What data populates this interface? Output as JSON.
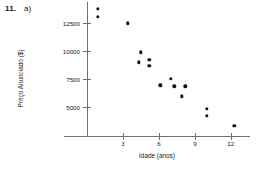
{
  "exercise": {
    "number": "11.",
    "part": "a)"
  },
  "chart_data": {
    "type": "scatter",
    "title": "",
    "xlabel": "Idade (anos)",
    "ylabel": "Preço Anunciado ($)",
    "xticks": [
      3,
      6,
      9,
      12
    ],
    "xtick_labels": [
      "3",
      "6",
      "9",
      "12"
    ],
    "yticks": [
      5000,
      7500,
      10000,
      12500
    ],
    "ytick_labels": [
      "5000",
      "7500",
      "10000",
      "12500"
    ],
    "xlim": [
      0,
      13.6
    ],
    "ylim": [
      2400,
      14400
    ],
    "grid": false,
    "legend": "none",
    "marker": "filled-circle",
    "marker_color": "#111111",
    "axis_color": "#6f6f6f",
    "points": [
      {
        "x": 0.9,
        "y": 13800
      },
      {
        "x": 0.9,
        "y": 13100
      },
      {
        "x": 3.4,
        "y": 12500
      },
      {
        "x": 4.3,
        "y": 9000
      },
      {
        "x": 4.5,
        "y": 9900
      },
      {
        "x": 5.2,
        "y": 9200
      },
      {
        "x": 5.2,
        "y": 8700
      },
      {
        "x": 6.1,
        "y": 6950
      },
      {
        "x": 7.0,
        "y": 7500
      },
      {
        "x": 7.3,
        "y": 6850
      },
      {
        "x": 7.9,
        "y": 5950
      },
      {
        "x": 8.2,
        "y": 6850
      },
      {
        "x": 10.0,
        "y": 4850
      },
      {
        "x": 10.0,
        "y": 4200
      },
      {
        "x": 12.3,
        "y": 3300
      }
    ]
  }
}
